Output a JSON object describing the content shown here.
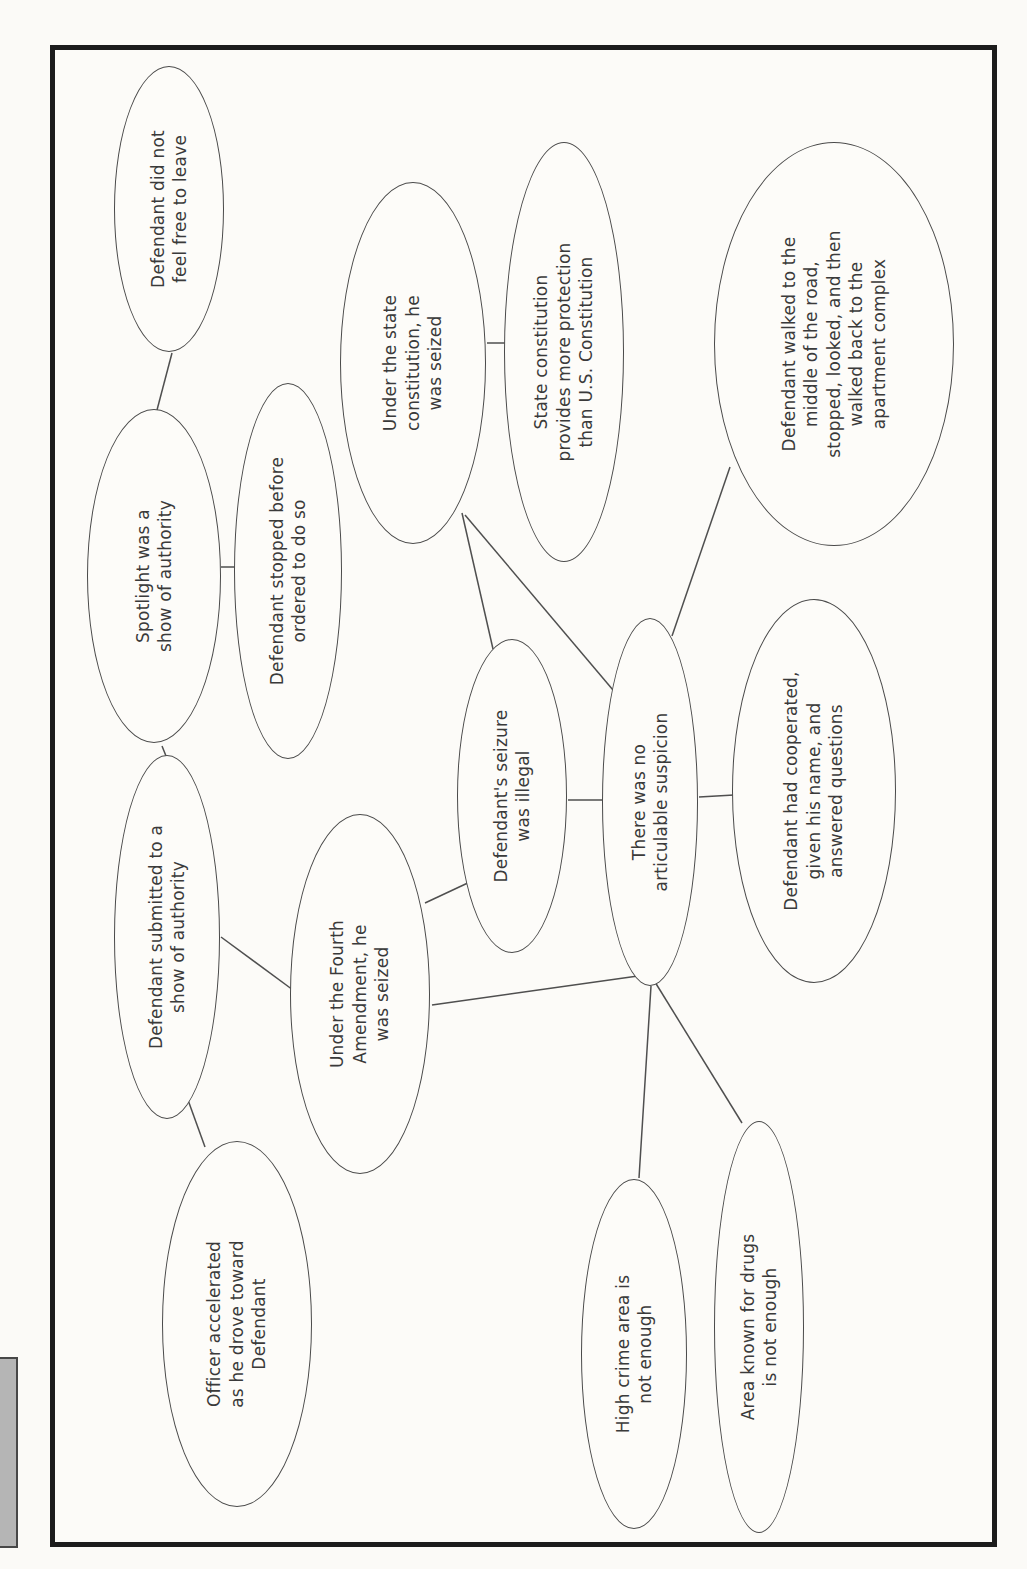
{
  "page": {
    "background": "#fbfaf7",
    "frame_border_color": "#1c1c1c",
    "side_tab_color": "#b5b5b5"
  },
  "diagram": {
    "type": "concept-map",
    "node_fill": "#fdfcf9",
    "node_border_color": "#4a4a4a",
    "edge_color": "#4f4f4f",
    "text_color": "#3a3a3a",
    "nodes": [
      {
        "id": "feel-free-to-leave",
        "text": "Defendant did not\nfeel free to leave",
        "cx": 1333,
        "cy": 114,
        "w": 286,
        "h": 110
      },
      {
        "id": "spotlight-authority",
        "text": "Spotlight was a\nshow of authority",
        "cx": 966,
        "cy": 99,
        "w": 334,
        "h": 134
      },
      {
        "id": "stopped-before-ordered",
        "text": "Defendant stopped before\nordered to do so",
        "cx": 971,
        "cy": 233,
        "w": 376,
        "h": 108
      },
      {
        "id": "state-constitution-seized",
        "text": "Under the state\nconstitution, he\nwas seized",
        "cx": 1179,
        "cy": 358,
        "w": 362,
        "h": 146
      },
      {
        "id": "state-more-protection",
        "text": "State constitution\nprovides more protection\nthan U.S. Constitution",
        "cx": 1190,
        "cy": 509,
        "w": 420,
        "h": 120
      },
      {
        "id": "walked-middle-road",
        "text": "Defendant walked to the\nmiddle of the road,\nstopped, looked, and then\nwalked back to the\napartment complex",
        "cx": 1198,
        "cy": 779,
        "w": 404,
        "h": 240
      },
      {
        "id": "submitted-authority",
        "text": "Defendant submitted to a\nshow of authority",
        "cx": 605,
        "cy": 112,
        "w": 364,
        "h": 106
      },
      {
        "id": "fourth-amendment-seized",
        "text": "Under the Fourth\nAmendment, he\nwas seized",
        "cx": 548,
        "cy": 305,
        "w": 360,
        "h": 140
      },
      {
        "id": "officer-accelerated",
        "text": "Officer accelerated\nas he drove toward\nDefendant",
        "cx": 218,
        "cy": 182,
        "w": 366,
        "h": 150
      },
      {
        "id": "seizure-illegal",
        "text": "Defendant's seizure\nwas illegal",
        "cx": 746,
        "cy": 457,
        "w": 314,
        "h": 110
      },
      {
        "id": "no-articulable-suspicion",
        "text": "There was no\narticulable suspicion",
        "cx": 740,
        "cy": 595,
        "w": 368,
        "h": 96
      },
      {
        "id": "defendant-cooperated",
        "text": "Defendant had cooperated,\ngiven his name, and\nanswered questions",
        "cx": 751,
        "cy": 759,
        "w": 384,
        "h": 164
      },
      {
        "id": "high-crime-area",
        "text": "High crime area is\nnot enough",
        "cx": 188,
        "cy": 579,
        "w": 350,
        "h": 106
      },
      {
        "id": "area-known-drugs",
        "text": "Area known for drugs\nis not enough",
        "cx": 215,
        "cy": 704,
        "w": 412,
        "h": 90
      }
    ],
    "edges": [
      {
        "from": "feel-free-to-leave",
        "to": "spotlight-authority",
        "x1": 1189,
        "y1": 117,
        "x2": 1132,
        "y2": 102
      },
      {
        "from": "spotlight-authority",
        "to": "stopped-before-ordered",
        "x1": 975,
        "y1": 166,
        "x2": 975,
        "y2": 180
      },
      {
        "from": "spotlight-authority",
        "to": "submitted-authority",
        "x1": 796,
        "y1": 107,
        "x2": 786,
        "y2": 111
      },
      {
        "from": "submitted-authority",
        "to": "officer-accelerated",
        "x1": 442,
        "y1": 133,
        "x2": 395,
        "y2": 150
      },
      {
        "from": "submitted-authority",
        "to": "fourth-amendment-seized",
        "x1": 605,
        "y1": 166,
        "x2": 552,
        "y2": 238
      },
      {
        "from": "fourth-amendment-seized",
        "to": "seizure-illegal",
        "x1": 639,
        "y1": 370,
        "x2": 661,
        "y2": 417
      },
      {
        "from": "fourth-amendment-seized",
        "to": "no-articulable-suspicion",
        "x1": 537,
        "y1": 377,
        "x2": 567,
        "y2": 590
      },
      {
        "from": "seizure-illegal",
        "to": "no-articulable-suspicion",
        "x1": 742,
        "y1": 513,
        "x2": 742,
        "y2": 549
      },
      {
        "from": "state-constitution-seized",
        "to": "seizure-illegal",
        "x1": 1029,
        "y1": 407,
        "x2": 893,
        "y2": 438
      },
      {
        "from": "state-constitution-seized",
        "to": "no-articulable-suspicion",
        "x1": 1027,
        "y1": 410,
        "x2": 852,
        "y2": 558
      },
      {
        "from": "state-constitution-seized",
        "to": "state-more-protection",
        "x1": 1199,
        "y1": 432,
        "x2": 1199,
        "y2": 451
      },
      {
        "from": "walked-middle-road",
        "to": "no-articulable-suspicion",
        "x1": 1075,
        "y1": 675,
        "x2": 906,
        "y2": 617
      },
      {
        "from": "no-articulable-suspicion",
        "to": "defendant-cooperated",
        "x1": 745,
        "y1": 644,
        "x2": 747,
        "y2": 679
      },
      {
        "from": "no-articulable-suspicion",
        "to": "high-crime-area",
        "x1": 556,
        "y1": 596,
        "x2": 364,
        "y2": 584
      },
      {
        "from": "no-articulable-suspicion",
        "to": "area-known-drugs",
        "x1": 560,
        "y1": 600,
        "x2": 419,
        "y2": 687
      }
    ]
  }
}
